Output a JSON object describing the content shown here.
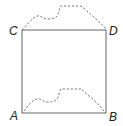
{
  "diagram": {
    "type": "geometry-figure",
    "colors": {
      "line": "#555555",
      "dashed": "#666666",
      "label": "#222222",
      "background": "#ffffff"
    },
    "points": {
      "A": {
        "label": "A",
        "x": 22,
        "y": 113
      },
      "B": {
        "label": "B",
        "x": 106,
        "y": 113
      },
      "C": {
        "label": "C",
        "x": 22,
        "y": 30
      },
      "D": {
        "label": "D",
        "x": 106,
        "y": 30
      }
    },
    "labels": {
      "A": "A",
      "B": "B",
      "C": "C",
      "D": "D"
    },
    "edges": [
      {
        "from": "C",
        "to": "D",
        "style": "solid"
      },
      {
        "from": "D",
        "to": "B",
        "style": "solid"
      },
      {
        "from": "B",
        "to": "A",
        "style": "solid"
      },
      {
        "from": "A",
        "to": "C",
        "style": "solid"
      }
    ],
    "curves": [
      {
        "name": "top-curve",
        "from": "C",
        "to": "D",
        "style": "dashed"
      },
      {
        "name": "bottom-curve",
        "from": "A",
        "to": "B",
        "style": "dashed"
      }
    ]
  }
}
